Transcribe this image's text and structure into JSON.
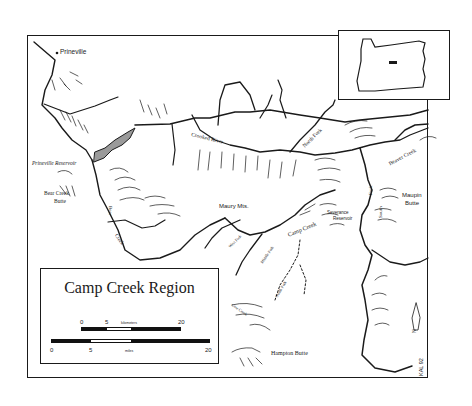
{
  "map": {
    "title": "Camp Creek Region",
    "credit": "KAL 92",
    "colors": {
      "ink": "#1a1a1a",
      "reservoir_fill": "#9a9a9a",
      "paper": "#ffffff"
    },
    "places": [
      {
        "id": "prineville",
        "label": "Prineville",
        "type": "town"
      },
      {
        "id": "prineville-reservoir",
        "label": "Prineville Reservoir",
        "type": "reservoir"
      },
      {
        "id": "bear-creek-butte",
        "label_line1": "Bear Creek",
        "label_line2": "Butte",
        "type": "peak"
      },
      {
        "id": "maury-mts",
        "label": "Maury Mts.",
        "type": "mountains"
      },
      {
        "id": "severance-reservoir",
        "label_line1": "Severance",
        "label_line2": "Reservoir",
        "type": "reservoir"
      },
      {
        "id": "maupin-butte",
        "label_line1": "Maupin",
        "label_line2": "Butte",
        "type": "peak"
      },
      {
        "id": "hampton-butte",
        "label": "Hampton Butte",
        "type": "peak"
      }
    ],
    "rivers": [
      {
        "id": "crooked-river",
        "label": "Crooked River"
      },
      {
        "id": "north-fork",
        "label": "North Fork"
      },
      {
        "id": "beaver-creek",
        "label": "Beaver Creek"
      },
      {
        "id": "bear-creek-a",
        "label": "Bear"
      },
      {
        "id": "bear-creek-b",
        "label": "Creek"
      },
      {
        "id": "camp-creek",
        "label": "Camp Creek"
      },
      {
        "id": "middle-fork",
        "label": "Middle Fork"
      },
      {
        "id": "south-fork",
        "label": "South Fork"
      },
      {
        "id": "west-fork",
        "label": "West Fork"
      },
      {
        "id": "east-fork",
        "label": "South Fork"
      },
      {
        "id": "fork-east",
        "label": "Fork"
      },
      {
        "id": "south-east",
        "label": "South"
      },
      {
        "id": "cow-creek",
        "label": "Cow Creek"
      }
    ],
    "scale_bar": {
      "kilometers": {
        "unit": "kilometers",
        "ticks": [
          "0",
          "5",
          "20"
        ]
      },
      "miles": {
        "unit": "miles",
        "ticks": [
          "0",
          "5",
          "20"
        ]
      }
    },
    "north_arrow": {
      "label": "N"
    },
    "inset": {
      "label": "Oregon locator",
      "marker": "study-area"
    }
  }
}
